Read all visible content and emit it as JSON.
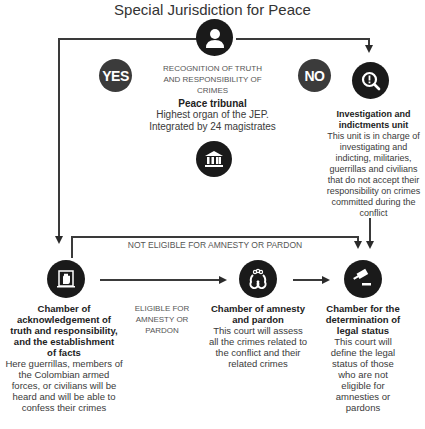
{
  "title": "Special Jurisdiction for Peace",
  "top": {
    "icon": "person-icon",
    "yes_label": "YES",
    "no_label": "NO",
    "question": "RECOGNITION OF TRUTH AND RESPONSIBILITY OF CRIMES",
    "tribunal_title": "Peace tribunal",
    "tribunal_desc_1": "Highest organ of the JEP.",
    "tribunal_desc_2": "Integrated by 24 magistrates",
    "tribunal_icon": "courthouse-icon"
  },
  "investigation": {
    "icon": "magnifier-alert-icon",
    "title": "Investigation and indictments unit",
    "desc": "This unit is in charge of investigating and indicting, militaries, guerrillas and civilians that do not accept their responsibility on crimes committed during the conflict"
  },
  "flow_labels": {
    "not_eligible": "NOT ELIGIBLE FOR AMNESTY OR PARDON",
    "eligible": "ELIGIBLE FOR AMNESTY OR PARDON"
  },
  "chambers": [
    {
      "icon": "raised-hand-icon",
      "title": "Chamber of acknowledgement of truth and responsibility, and the establishment of facts",
      "desc": "Here guerrillas, members of the Colombian armed forces, or civilians will be heard and will be able to confess their crimes"
    },
    {
      "icon": "handcuffs-icon",
      "title": "Chamber of amnesty and pardon",
      "desc": "This court will assess all the crimes related to the conflict and their related crimes"
    },
    {
      "icon": "gavel-icon",
      "title": "Chamber for the determination of legal status",
      "desc": "This court will define the legal status of those who are not eligible for amnesties or pardons"
    }
  ],
  "colors": {
    "icon_fill": "#1a1a1a",
    "badge_fill": "#3b3b3b",
    "line": "#3a3a3a"
  }
}
